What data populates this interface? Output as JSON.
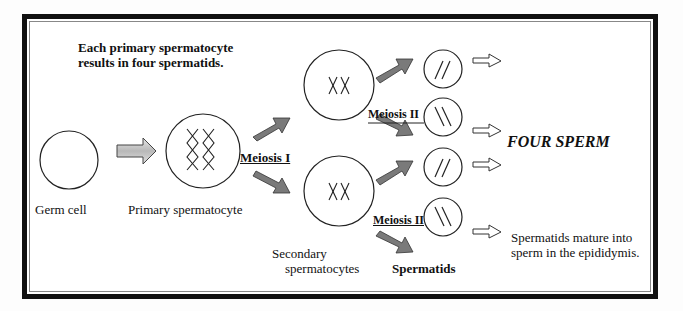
{
  "title": {
    "line1": "Each primary spermatocyte",
    "line2": "results in four spermatids."
  },
  "cells": {
    "germ": "Germ cell",
    "primary": "Primary spermatocyte",
    "secondary_line1": "Secondary",
    "secondary_line2": "spermatocytes",
    "spermatids": "Spermatids"
  },
  "stages": {
    "meiosis1": "Meiosis I",
    "meiosis2_top": "Meiosis II",
    "meiosis2_bottom": "Meiosis II"
  },
  "outcome": {
    "four_sperm": "FOUR SPERM",
    "mature_line1": "Spermatids mature into",
    "mature_line2": "sperm in the epididymis."
  },
  "colors": {
    "arrow_dark": "#7a7a7a",
    "arrow_light": "#c8c8c8",
    "border": "#111111"
  }
}
